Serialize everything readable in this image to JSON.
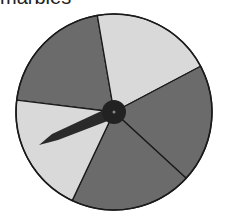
{
  "title": "marbles",
  "spinner": {
    "sector_count": 5,
    "sectors": [
      {
        "name": "top-left",
        "shade": "dark"
      },
      {
        "name": "top-right",
        "shade": "light"
      },
      {
        "name": "right",
        "shade": "dark"
      },
      {
        "name": "bottom",
        "shade": "dark"
      },
      {
        "name": "left",
        "shade": "light"
      }
    ],
    "pointer_points_to": "left",
    "colors": {
      "dark": "#6b6b6b",
      "light": "#d9d9d9",
      "outline": "#1a1a1a",
      "hub": "#222222",
      "pointer": "#2a2a2a"
    }
  }
}
